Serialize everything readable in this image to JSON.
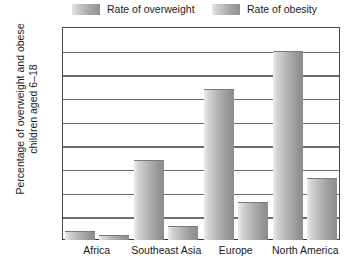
{
  "chart_data": {
    "type": "bar",
    "title": "",
    "xlabel": "",
    "ylabel": "Percentage of overweight and obese children aged 6–18",
    "ylabel_line1": "Percentage of overweight and obese",
    "ylabel_line2": "children aged 6–18",
    "categories": [
      "Africa",
      "Southeast Asia",
      "Europe",
      "North America"
    ],
    "series": [
      {
        "name": "Rate of overweight",
        "values": [
          2,
          17,
          32,
          40
        ]
      },
      {
        "name": "Rate of obesity",
        "values": [
          1,
          3,
          8,
          13
        ]
      }
    ],
    "ylim": [
      0,
      45
    ],
    "ytick_step": 5,
    "yticks": [
      0,
      5,
      10,
      15,
      20,
      25,
      30,
      35,
      40,
      45
    ],
    "ytick_labels": [
      "0",
      "5",
      "10",
      "15",
      "20",
      "25",
      "30",
      "35",
      "40",
      "45"
    ],
    "grid": "horizontal",
    "legend_position": "top",
    "legend": [
      "Rate of overweight",
      "Rate of obesity"
    ],
    "colors": {
      "bar_light": "#ededed",
      "bar_dark": "#8c8c8c",
      "gridline": "#6e6e6e",
      "axis": "#3a3a3a",
      "text": "#1a1a1a",
      "background": "#ffffff"
    }
  }
}
